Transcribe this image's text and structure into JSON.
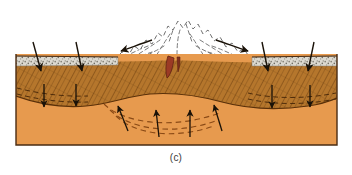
{
  "figure": {
    "caption": "(c)",
    "panel_letter": "c"
  },
  "canvas": {
    "width": 352,
    "height": 175,
    "background": "#ffffff"
  },
  "block": {
    "left": 16,
    "right": 337,
    "top": 54,
    "bottom": 145,
    "outline_color": "#4a2c13"
  },
  "layers": [
    {
      "name": "ice-sheet",
      "label": "ice sheet / snowfield",
      "fill": "#ffffff",
      "outline": "#6b6b6b",
      "line_style": "dashed"
    },
    {
      "name": "sediment-veneer",
      "label": "stippled surface deposit",
      "fill": "#d8d5cc",
      "speckle": "#7d7a70"
    },
    {
      "name": "lithosphere-crust",
      "label": "lithosphere (hatched crust)",
      "fill": "#b5762c",
      "hatch": "#6b3d10"
    },
    {
      "name": "asthenosphere",
      "label": "asthenosphere (mantle)",
      "fill": "#e79a4e",
      "flow_line": "#8a4a16"
    },
    {
      "name": "magma-conduit",
      "label": "magma conduit / volcanic vent",
      "fill": "#9e3b26",
      "outline": "#5e2212"
    }
  ],
  "arrows": {
    "downward_load_surface": [
      {
        "name": "surface-load-arrow-1",
        "x": 40,
        "y_from": 42,
        "y_to": 72
      },
      {
        "name": "surface-load-arrow-2",
        "x": 82,
        "y_from": 42,
        "y_to": 72
      },
      {
        "name": "surface-load-arrow-3",
        "x": 268,
        "y_from": 42,
        "y_to": 72
      },
      {
        "name": "surface-load-arrow-4",
        "x": 308,
        "y_from": 42,
        "y_to": 72
      }
    ],
    "downward_load_deep": [
      {
        "name": "deep-load-arrow-1",
        "x": 44,
        "y_from": 85,
        "y_to": 107
      },
      {
        "name": "deep-load-arrow-2",
        "x": 76,
        "y_from": 85,
        "y_to": 107
      },
      {
        "name": "deep-load-arrow-3",
        "x": 272,
        "y_from": 85,
        "y_to": 107
      },
      {
        "name": "deep-load-arrow-4",
        "x": 310,
        "y_from": 85,
        "y_to": 107
      }
    ],
    "upward_mantle_flow": [
      {
        "name": "mantle-flow-arrow-1"
      },
      {
        "name": "mantle-flow-arrow-2"
      },
      {
        "name": "mantle-flow-arrow-3"
      },
      {
        "name": "mantle-flow-arrow-4"
      }
    ],
    "ice_outflow": [
      {
        "name": "ice-outflow-arrow-left",
        "direction": "down-left"
      },
      {
        "name": "ice-outflow-arrow-right",
        "direction": "down-right"
      }
    ]
  },
  "colors": {
    "ice_white": "#ffffff",
    "ice_outline": "#6b6b6b",
    "sediment_gray": "#d8d5cc",
    "crust_brown": "#b5762c",
    "crust_hatch": "#6b3d10",
    "mantle_orange": "#e79a4e",
    "mantle_dash": "#8a4a16",
    "magma_red": "#9e3b26",
    "arrow_black": "#1a1208",
    "caption_gray": "#3a3a3a"
  }
}
